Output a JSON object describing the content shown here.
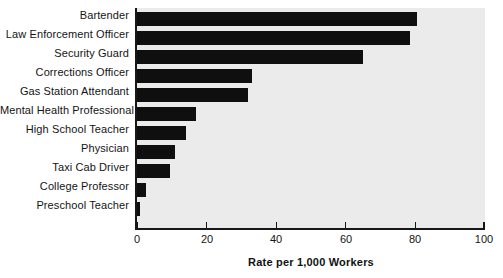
{
  "chart_data": {
    "type": "bar",
    "orientation": "horizontal",
    "title": "",
    "xlabel": "Rate per 1,000 Workers",
    "ylabel": "",
    "xlim": [
      0,
      100
    ],
    "xticks": [
      0,
      20,
      40,
      60,
      80,
      100
    ],
    "xtick_labels": [
      "0",
      "20",
      "40",
      "60",
      "80",
      "100"
    ],
    "grid": false,
    "legend": false,
    "bar_color": "#100f0f",
    "plot_background": "#ebebeb",
    "categories": [
      "Bartender",
      "Law Enforcement Officer",
      "Security Guard",
      "Corrections Officer",
      "Gas Station Attendant",
      "Mental Health Professional",
      "High School Teacher",
      "Physician",
      "Taxi Cab Driver",
      "College Professor",
      "Preschool Teacher"
    ],
    "values": [
      80.5,
      78.5,
      65,
      33,
      32,
      17,
      14,
      11,
      9.5,
      2.5,
      1
    ]
  }
}
